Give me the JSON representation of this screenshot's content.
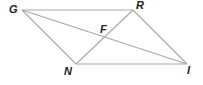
{
  "diagram": {
    "type": "parallelogram-with-diagonals",
    "line_color": "#a8a8a8",
    "label_color": "#222222",
    "vertices": [
      {
        "name": "G",
        "x": 22,
        "y": 10,
        "label_x": 9,
        "label_y": 13
      },
      {
        "name": "R",
        "x": 133,
        "y": 10,
        "label_x": 136,
        "label_y": 9
      },
      {
        "name": "I",
        "x": 187,
        "y": 64,
        "label_x": 187,
        "label_y": 74
      },
      {
        "name": "N",
        "x": 76,
        "y": 64,
        "label_x": 64,
        "label_y": 75
      }
    ],
    "intersection": {
      "name": "F",
      "x": 105,
      "y": 37,
      "label_x": 100,
      "label_y": 33
    },
    "labels": {
      "G": "G",
      "R": "R",
      "I": "I",
      "N": "N",
      "F": "F"
    },
    "edges": [
      [
        "G",
        "R"
      ],
      [
        "R",
        "I"
      ],
      [
        "I",
        "N"
      ],
      [
        "N",
        "G"
      ],
      [
        "G",
        "I"
      ],
      [
        "R",
        "N"
      ]
    ]
  }
}
